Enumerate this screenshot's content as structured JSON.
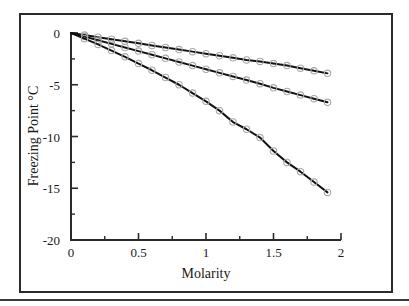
{
  "chart_data": {
    "type": "line",
    "title": "",
    "xlabel": "Molarity",
    "ylabel": "Freezing Point °C",
    "xlim": [
      0,
      2
    ],
    "ylim": [
      -20,
      0
    ],
    "xticks": [
      "0",
      "0.5",
      "1",
      "1.5",
      "2"
    ],
    "xtick_values": [
      0,
      0.5,
      1,
      1.5,
      2
    ],
    "yticks": [
      "0",
      "-5",
      "-10",
      "-15",
      "-20"
    ],
    "ytick_values": [
      0,
      -5,
      -10,
      -15,
      -20
    ],
    "x_minor_ticks": [
      0.25,
      0.75,
      1.25,
      1.75
    ],
    "y_minor_ticks": [
      -2.5,
      -7.5,
      -12.5,
      -17.5
    ],
    "grid": false,
    "legend": "none",
    "marker": "open-circle",
    "marker_color": "#a9a9a9",
    "line_color": "#111111",
    "series": [
      {
        "name": "curve-upper",
        "x": [
          0,
          0.1,
          0.2,
          0.3,
          0.4,
          0.5,
          0.6,
          0.7,
          0.8,
          0.9,
          1.0,
          1.1,
          1.2,
          1.3,
          1.4,
          1.5,
          1.6,
          1.7,
          1.8,
          1.9
        ],
        "values": [
          0,
          -0.2,
          -0.4,
          -0.6,
          -0.8,
          -1.0,
          -1.2,
          -1.4,
          -1.6,
          -1.8,
          -2.0,
          -2.2,
          -2.4,
          -2.6,
          -2.75,
          -2.95,
          -3.15,
          -3.4,
          -3.65,
          -3.9
        ]
      },
      {
        "name": "curve-middle",
        "x": [
          0,
          0.1,
          0.2,
          0.3,
          0.4,
          0.5,
          0.6,
          0.7,
          0.8,
          0.9,
          1.0,
          1.1,
          1.2,
          1.3,
          1.4,
          1.5,
          1.6,
          1.7,
          1.8,
          1.9
        ],
        "values": [
          0,
          -0.35,
          -0.7,
          -1.05,
          -1.4,
          -1.75,
          -2.1,
          -2.45,
          -2.8,
          -3.15,
          -3.5,
          -3.85,
          -4.2,
          -4.55,
          -4.9,
          -5.3,
          -5.65,
          -6.0,
          -6.35,
          -6.7
        ]
      },
      {
        "name": "curve-lower",
        "x": [
          0,
          0.1,
          0.2,
          0.3,
          0.4,
          0.5,
          0.6,
          0.7,
          0.8,
          0.9,
          1.0,
          1.1,
          1.2,
          1.3,
          1.4,
          1.5,
          1.6,
          1.7,
          1.8,
          1.9
        ],
        "values": [
          0,
          -0.55,
          -1.1,
          -1.7,
          -2.3,
          -2.95,
          -3.6,
          -4.3,
          -5.0,
          -5.8,
          -6.6,
          -7.5,
          -8.6,
          -9.3,
          -10.1,
          -11.4,
          -12.5,
          -13.4,
          -14.4,
          -15.4
        ]
      }
    ]
  },
  "axis_titles": {
    "x": "Molarity",
    "y": "Freezing Point °C"
  }
}
